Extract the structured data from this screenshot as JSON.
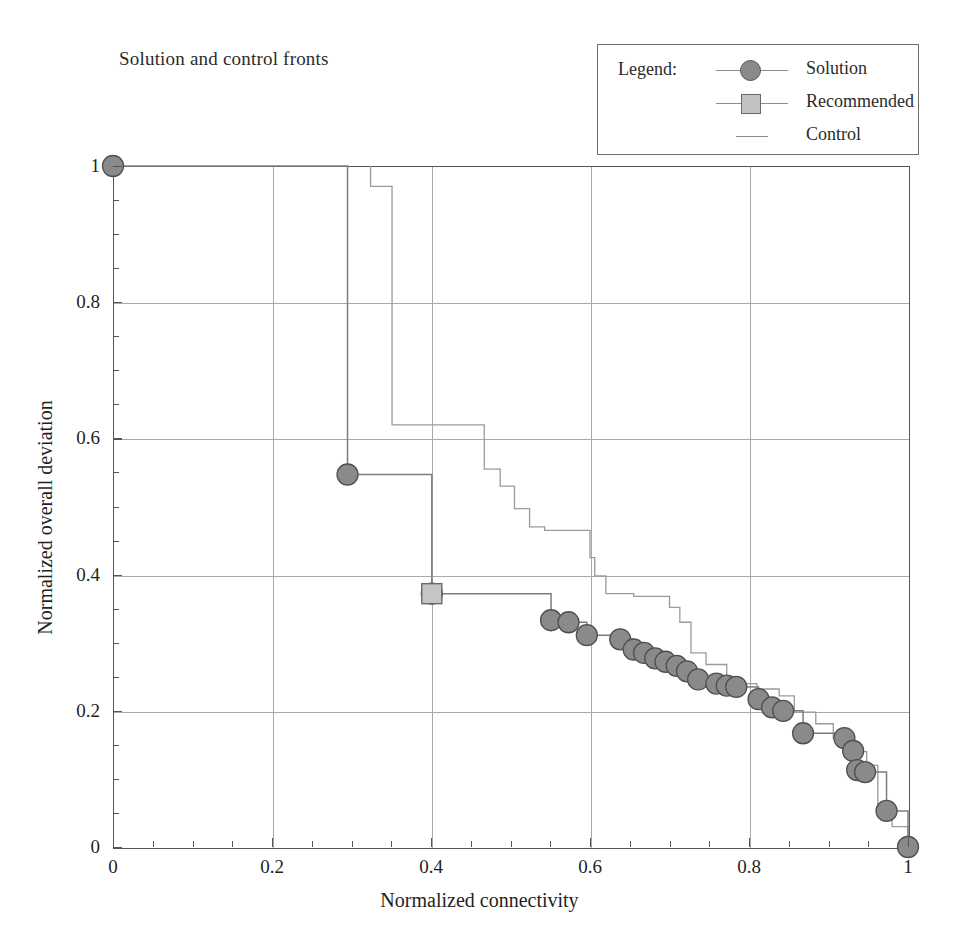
{
  "title": "Solution and control fronts",
  "legend": {
    "heading": "Legend:",
    "entries": [
      {
        "label": "Solution",
        "marker": "circle",
        "color": "#8a8a8a"
      },
      {
        "label": "Recommended",
        "marker": "square",
        "color": "#c5c5c5"
      },
      {
        "label": "Control",
        "marker": "line",
        "color": "#9a9a9a"
      }
    ]
  },
  "axes": {
    "x": {
      "title": "Normalized connectivity",
      "ticks": [
        "0",
        "0.2",
        "0.4",
        "0.6",
        "0.8",
        "1"
      ],
      "min": 0,
      "max": 1
    },
    "y": {
      "title": "Normalized overall deviation",
      "ticks": [
        "0",
        "0.2",
        "0.4",
        "0.6",
        "0.8",
        "1"
      ],
      "min": 0,
      "max": 1
    }
  },
  "chart_data": {
    "type": "scatter",
    "title": "Solution and control fronts",
    "xlabel": "Normalized connectivity",
    "ylabel": "Normalized overall deviation",
    "xlim": [
      0,
      1
    ],
    "ylim": [
      0,
      1
    ],
    "grid": true,
    "legend_position": "top-right-outside",
    "xticks": [
      0,
      0.2,
      0.4,
      0.6,
      0.8,
      1
    ],
    "yticks": [
      0,
      0.2,
      0.4,
      0.6,
      0.8,
      1
    ],
    "series": [
      {
        "name": "Solution",
        "marker": "circle",
        "color": "#8a8a8a",
        "points": [
          [
            0.0,
            1.0
          ],
          [
            0.295,
            0.547
          ],
          [
            0.401,
            0.372
          ],
          [
            0.551,
            0.333
          ],
          [
            0.573,
            0.33
          ],
          [
            0.596,
            0.311
          ],
          [
            0.638,
            0.305
          ],
          [
            0.655,
            0.29
          ],
          [
            0.668,
            0.285
          ],
          [
            0.682,
            0.277
          ],
          [
            0.695,
            0.272
          ],
          [
            0.709,
            0.266
          ],
          [
            0.722,
            0.258
          ],
          [
            0.736,
            0.246
          ],
          [
            0.759,
            0.24
          ],
          [
            0.772,
            0.237
          ],
          [
            0.784,
            0.235
          ],
          [
            0.812,
            0.217
          ],
          [
            0.829,
            0.205
          ],
          [
            0.843,
            0.2
          ],
          [
            0.868,
            0.167
          ],
          [
            0.92,
            0.16
          ],
          [
            0.931,
            0.141
          ],
          [
            0.936,
            0.113
          ],
          [
            0.946,
            0.11
          ],
          [
            0.973,
            0.053
          ],
          [
            1.0,
            0.0
          ]
        ],
        "front_steps": [
          [
            0.0,
            1.0
          ],
          [
            0.295,
            1.0
          ],
          [
            0.295,
            0.547
          ],
          [
            0.401,
            0.547
          ],
          [
            0.401,
            0.372
          ],
          [
            0.551,
            0.372
          ],
          [
            0.551,
            0.333
          ],
          [
            0.573,
            0.333
          ],
          [
            0.573,
            0.33
          ],
          [
            0.596,
            0.33
          ],
          [
            0.596,
            0.311
          ],
          [
            0.638,
            0.311
          ],
          [
            0.638,
            0.305
          ],
          [
            0.655,
            0.305
          ],
          [
            0.655,
            0.29
          ],
          [
            0.668,
            0.29
          ],
          [
            0.668,
            0.285
          ],
          [
            0.682,
            0.285
          ],
          [
            0.682,
            0.277
          ],
          [
            0.695,
            0.277
          ],
          [
            0.695,
            0.272
          ],
          [
            0.709,
            0.272
          ],
          [
            0.709,
            0.266
          ],
          [
            0.722,
            0.266
          ],
          [
            0.722,
            0.258
          ],
          [
            0.736,
            0.258
          ],
          [
            0.736,
            0.246
          ],
          [
            0.759,
            0.246
          ],
          [
            0.759,
            0.24
          ],
          [
            0.772,
            0.24
          ],
          [
            0.772,
            0.237
          ],
          [
            0.784,
            0.237
          ],
          [
            0.784,
            0.235
          ],
          [
            0.812,
            0.235
          ],
          [
            0.812,
            0.217
          ],
          [
            0.829,
            0.217
          ],
          [
            0.829,
            0.205
          ],
          [
            0.843,
            0.205
          ],
          [
            0.843,
            0.2
          ],
          [
            0.868,
            0.2
          ],
          [
            0.868,
            0.167
          ],
          [
            0.92,
            0.167
          ],
          [
            0.92,
            0.16
          ],
          [
            0.931,
            0.16
          ],
          [
            0.931,
            0.141
          ],
          [
            0.936,
            0.141
          ],
          [
            0.936,
            0.113
          ],
          [
            0.946,
            0.113
          ],
          [
            0.946,
            0.11
          ],
          [
            0.973,
            0.11
          ],
          [
            0.973,
            0.053
          ],
          [
            1.0,
            0.053
          ],
          [
            1.0,
            0.0
          ]
        ]
      },
      {
        "name": "Recommended",
        "marker": "square",
        "color": "#c5c5c5",
        "points": [
          [
            0.401,
            0.372
          ]
        ]
      },
      {
        "name": "Control",
        "marker": "line",
        "color": "#9a9a9a",
        "front_steps": [
          [
            0.324,
            1.0
          ],
          [
            0.324,
            0.97
          ],
          [
            0.351,
            0.97
          ],
          [
            0.351,
            0.62
          ],
          [
            0.467,
            0.62
          ],
          [
            0.467,
            0.555
          ],
          [
            0.487,
            0.555
          ],
          [
            0.487,
            0.53
          ],
          [
            0.505,
            0.53
          ],
          [
            0.505,
            0.497
          ],
          [
            0.524,
            0.497
          ],
          [
            0.524,
            0.47
          ],
          [
            0.543,
            0.47
          ],
          [
            0.543,
            0.465
          ],
          [
            0.6,
            0.465
          ],
          [
            0.6,
            0.425
          ],
          [
            0.606,
            0.425
          ],
          [
            0.606,
            0.398
          ],
          [
            0.62,
            0.398
          ],
          [
            0.62,
            0.372
          ],
          [
            0.655,
            0.372
          ],
          [
            0.655,
            0.368
          ],
          [
            0.7,
            0.368
          ],
          [
            0.7,
            0.352
          ],
          [
            0.713,
            0.352
          ],
          [
            0.713,
            0.33
          ],
          [
            0.727,
            0.33
          ],
          [
            0.727,
            0.285
          ],
          [
            0.746,
            0.285
          ],
          [
            0.746,
            0.268
          ],
          [
            0.772,
            0.268
          ],
          [
            0.772,
            0.248
          ],
          [
            0.79,
            0.248
          ],
          [
            0.79,
            0.24
          ],
          [
            0.81,
            0.24
          ],
          [
            0.81,
            0.232
          ],
          [
            0.838,
            0.232
          ],
          [
            0.838,
            0.222
          ],
          [
            0.857,
            0.222
          ],
          [
            0.857,
            0.198
          ],
          [
            0.884,
            0.198
          ],
          [
            0.884,
            0.181
          ],
          [
            0.906,
            0.181
          ],
          [
            0.906,
            0.16
          ],
          [
            0.93,
            0.16
          ],
          [
            0.93,
            0.14
          ],
          [
            0.948,
            0.14
          ],
          [
            0.948,
            0.12
          ],
          [
            0.962,
            0.12
          ],
          [
            0.962,
            0.062
          ],
          [
            0.98,
            0.062
          ],
          [
            0.98,
            0.03
          ],
          [
            1.0,
            0.03
          ],
          [
            1.0,
            0.0
          ]
        ]
      }
    ]
  }
}
